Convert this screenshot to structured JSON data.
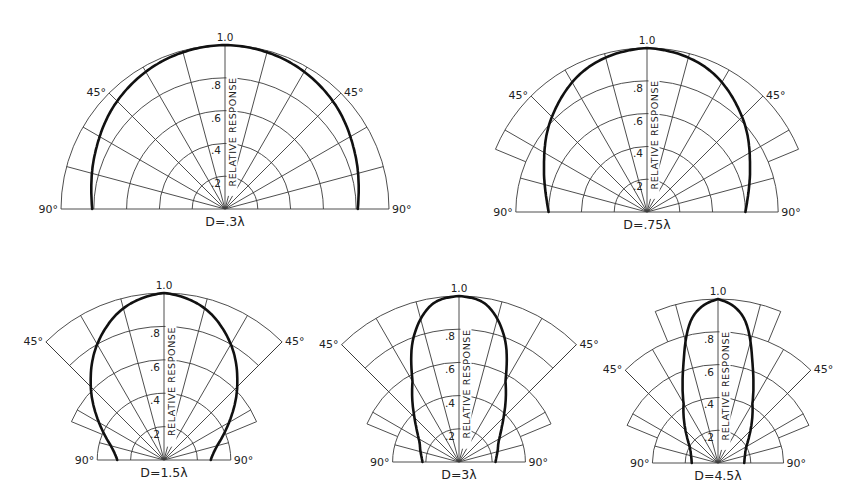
{
  "chart_data": [
    {
      "type": "polar-line",
      "title": "D=.3λ",
      "radial_label": "RELATIVE RESPONSE",
      "radial_ticks": [
        ".2",
        ".4",
        ".6",
        ".8",
        "1.0"
      ],
      "radial_range": [
        0,
        1.0
      ],
      "angle_labels": [
        "45°",
        "45°",
        "90°",
        "90°"
      ],
      "angle_range_deg": [
        -90,
        90
      ],
      "grid": true,
      "series": [
        {
          "name": "D=.3λ",
          "angles_deg": [
            0,
            22.5,
            45,
            67.5,
            90
          ],
          "values": [
            1.0,
            0.98,
            0.93,
            0.86,
            0.81
          ]
        }
      ]
    },
    {
      "type": "polar-line",
      "title": "D=.75λ",
      "radial_label": "RELATIVE RESPONSE",
      "radial_ticks": [
        ".2",
        ".4",
        ".6",
        ".8",
        "1.0"
      ],
      "radial_range": [
        0,
        1.0
      ],
      "angle_labels": [
        "45°",
        "45°",
        "90°",
        "90°"
      ],
      "angle_range_deg": [
        -90,
        90
      ],
      "grid": true,
      "series": [
        {
          "name": "D=.75λ",
          "angles_deg": [
            0,
            22.5,
            45,
            67.5,
            90
          ],
          "values": [
            1.0,
            0.95,
            0.82,
            0.68,
            0.6
          ]
        }
      ]
    },
    {
      "type": "polar-line",
      "title": "D=1.5λ",
      "radial_label": "RELATIVE RESPONSE",
      "radial_ticks": [
        ".2",
        ".4",
        ".6",
        ".8",
        "1.0"
      ],
      "radial_range": [
        0,
        1.0
      ],
      "angle_labels": [
        "45°",
        "45°",
        "90°",
        "90°"
      ],
      "angle_range_deg": [
        -90,
        90
      ],
      "grid": true,
      "series": [
        {
          "name": "D=1.5λ",
          "angles_deg": [
            0,
            15,
            30,
            45,
            60,
            75,
            90
          ],
          "values": [
            1.0,
            0.94,
            0.8,
            0.62,
            0.45,
            0.33,
            0.28
          ]
        }
      ]
    },
    {
      "type": "polar-line",
      "title": "D=3λ",
      "radial_label": "RELATIVE RESPONSE",
      "radial_ticks": [
        ".2",
        ".4",
        ".6",
        ".8",
        "1.0"
      ],
      "radial_range": [
        0,
        1.0
      ],
      "angle_labels": [
        "45°",
        "45°",
        "90°",
        "90°"
      ],
      "angle_range_deg": [
        -90,
        90
      ],
      "grid": true,
      "series": [
        {
          "name": "D=3λ",
          "angles_deg": [
            0,
            10,
            20,
            30,
            45,
            60,
            75,
            90
          ],
          "values": [
            1.0,
            0.96,
            0.8,
            0.56,
            0.38,
            0.28,
            0.24,
            0.22
          ]
        }
      ]
    },
    {
      "type": "polar-line",
      "title": "D=4.5λ",
      "radial_label": "RELATIVE RESPONSE",
      "radial_ticks": [
        ".2",
        ".4",
        ".6",
        ".8",
        "1.0"
      ],
      "radial_range": [
        0,
        1.0
      ],
      "angle_labels": [
        "45°",
        "45°",
        "90°",
        "90°"
      ],
      "angle_range_deg": [
        -90,
        90
      ],
      "grid": true,
      "series": [
        {
          "name": "D=4.5λ",
          "angles_deg": [
            0,
            10,
            20,
            30,
            45,
            60,
            75,
            90
          ],
          "values": [
            1.0,
            0.9,
            0.62,
            0.42,
            0.28,
            0.2,
            0.17,
            0.16
          ]
        }
      ]
    }
  ]
}
